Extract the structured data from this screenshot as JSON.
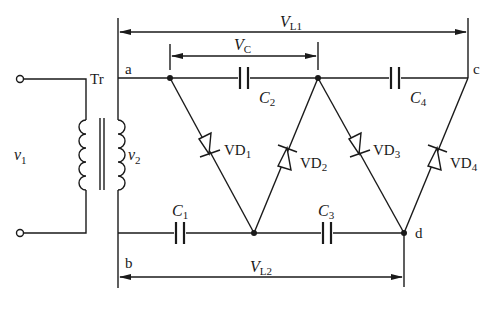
{
  "diagram": {
    "type": "circuit-schematic",
    "colors": {
      "line": "#1a1a1a",
      "background": "#ffffff"
    },
    "labels": {
      "transformer": "Tr",
      "input_voltage": "v",
      "input_voltage_sub": "1",
      "secondary_voltage": "v",
      "secondary_voltage_sub": "2",
      "node_a": "a",
      "node_b": "b",
      "node_c": "c",
      "node_d": "d",
      "vl1": "V",
      "vl1_sub": "L1",
      "vl2": "V",
      "vl2_sub": "L2",
      "vc": "V",
      "vc_sub": "C",
      "c1": "C",
      "c1_sub": "1",
      "c2": "C",
      "c2_sub": "2",
      "c3": "C",
      "c3_sub": "3",
      "c4": "C",
      "c4_sub": "4",
      "vd1": "VD",
      "vd1_sub": "1",
      "vd2": "VD",
      "vd2_sub": "2",
      "vd3": "VD",
      "vd3_sub": "3",
      "vd4": "VD",
      "vd4_sub": "4"
    },
    "components": [
      {
        "id": "Tr",
        "kind": "transformer"
      },
      {
        "id": "C1",
        "kind": "capacitor",
        "between": [
          "b",
          "lower-mid"
        ]
      },
      {
        "id": "C2",
        "kind": "capacitor",
        "between": [
          "upper-left",
          "upper-mid"
        ]
      },
      {
        "id": "C3",
        "kind": "capacitor",
        "between": [
          "lower-mid",
          "d"
        ]
      },
      {
        "id": "C4",
        "kind": "capacitor",
        "between": [
          "upper-mid",
          "c"
        ]
      },
      {
        "id": "VD1",
        "kind": "diode",
        "between": [
          "upper-left",
          "lower-mid"
        ]
      },
      {
        "id": "VD2",
        "kind": "diode",
        "between": [
          "lower-mid",
          "upper-mid"
        ]
      },
      {
        "id": "VD3",
        "kind": "diode",
        "between": [
          "upper-mid",
          "d"
        ]
      },
      {
        "id": "VD4",
        "kind": "diode",
        "between": [
          "d",
          "c"
        ]
      }
    ]
  }
}
